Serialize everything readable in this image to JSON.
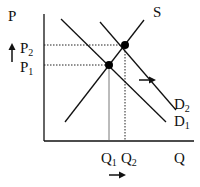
{
  "diagram": {
    "axes": {
      "y_label": "P",
      "x_label": "Q"
    },
    "curves": {
      "supply": "S",
      "demand_1": {
        "base": "D",
        "sub": "1"
      },
      "demand_2": {
        "base": "D",
        "sub": "2"
      }
    },
    "price_levels": {
      "p1": {
        "base": "P",
        "sub": "1"
      },
      "p2": {
        "base": "P",
        "sub": "2"
      }
    },
    "quantity_levels": {
      "q1": {
        "base": "Q",
        "sub": "1"
      },
      "q2": {
        "base": "Q",
        "sub": "2"
      }
    },
    "annotations": {
      "price_arrow": "up",
      "demand_shift_arrow": "right",
      "quantity_arrow": "right"
    },
    "colors": {
      "line": "#111111",
      "background": "#ffffff"
    }
  }
}
